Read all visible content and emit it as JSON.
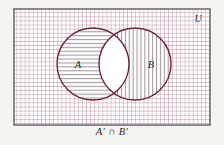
{
  "figure": {
    "type": "venn-diagram",
    "title_caption": "A′ ∩ B′",
    "universal_set_label": "U",
    "set_a_label": "A",
    "set_b_label": "B",
    "shaded_region_description": "A′ ∩ B′",
    "colors": {
      "page_background": "#f6f4f1",
      "rect_border": "#6e6e72",
      "rect_fill": "#ffffff",
      "grid_hatch": "#c6a3ad",
      "circle_outline": "#6b2430",
      "circle_hatch": "#9a8f93",
      "label_text": "#2b2b2b"
    },
    "universe_rect": {
      "x": 14,
      "y": 9,
      "width": 196,
      "height": 116,
      "grid_cell": 4.1
    },
    "circles": [
      {
        "name": "A",
        "cx": 93,
        "cy": 64,
        "r": 36,
        "hatch": "horizontal",
        "label_x": 78,
        "label_y": 68
      },
      {
        "name": "B",
        "cx": 135,
        "cy": 64,
        "r": 36,
        "hatch": "vertical",
        "label_x": 151,
        "label_y": 68
      }
    ],
    "u_label_pos": {
      "x": 198,
      "y": 21
    }
  }
}
